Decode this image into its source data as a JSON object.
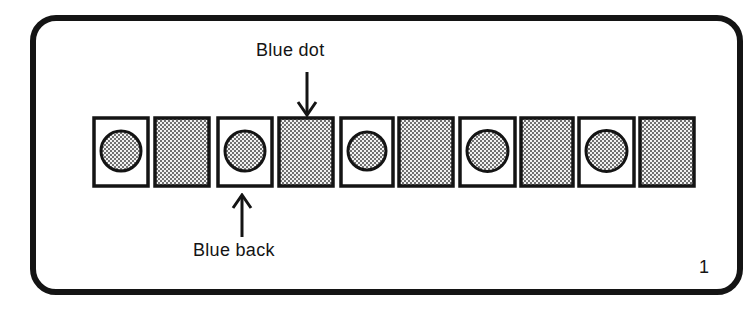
{
  "diagram": {
    "figure_number": "1",
    "labels": {
      "top": "Blue dot",
      "bottom": "Blue back"
    },
    "colors": {
      "ink": "#141414",
      "paper": "#ffffff",
      "screen_dot": "#3a3a3a"
    },
    "cards": [
      {
        "index": 1,
        "side": "dot",
        "x": 92,
        "y": 116,
        "w": 58,
        "h": 72
      },
      {
        "index": 2,
        "side": "back",
        "x": 153,
        "y": 116,
        "w": 58,
        "h": 72
      },
      {
        "index": 3,
        "side": "dot",
        "x": 216,
        "y": 116,
        "w": 58,
        "h": 72
      },
      {
        "index": 4,
        "side": "back",
        "x": 277,
        "y": 116,
        "w": 58,
        "h": 72
      },
      {
        "index": 5,
        "side": "dot",
        "x": 339,
        "y": 116,
        "w": 56,
        "h": 72
      },
      {
        "index": 6,
        "side": "back",
        "x": 397,
        "y": 116,
        "w": 58,
        "h": 72
      },
      {
        "index": 7,
        "side": "dot",
        "x": 458,
        "y": 116,
        "w": 59,
        "h": 72
      },
      {
        "index": 8,
        "side": "back",
        "x": 519,
        "y": 116,
        "w": 56,
        "h": 72
      },
      {
        "index": 9,
        "side": "dot",
        "x": 577,
        "y": 116,
        "w": 59,
        "h": 72
      },
      {
        "index": 10,
        "side": "back",
        "x": 638,
        "y": 116,
        "w": 58,
        "h": 72
      }
    ],
    "pointers": [
      {
        "label_key": "top",
        "target_card": 4,
        "direction": "down"
      },
      {
        "label_key": "bottom",
        "target_card": 3,
        "direction": "up"
      }
    ]
  }
}
